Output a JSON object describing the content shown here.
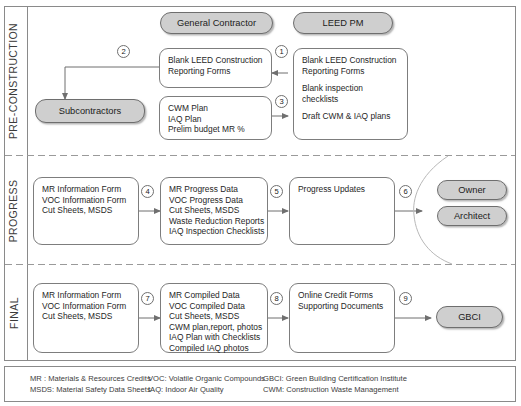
{
  "diagram": {
    "frame_color": "#8a8a8a",
    "box_border_color": "#7d7d7d",
    "pill_fill_color": "#cfcfcf",
    "arrow_color": "#6f6f6f"
  },
  "phases": [
    {
      "id": "pre-construction",
      "label": "PRE-CONSTRUCTION"
    },
    {
      "id": "progress",
      "label": "PROGRESS"
    },
    {
      "id": "final",
      "label": "FINAL"
    }
  ],
  "actors": {
    "general_contractor": "General Contractor",
    "leed_pm": "LEED PM",
    "subcontractors": "Subcontractors",
    "owner": "Owner",
    "architect": "Architect",
    "gbci": "GBCI"
  },
  "preconstruction": {
    "gc_forms_box": {
      "lines": [
        "Blank LEED Construction",
        "Reporting Forms"
      ]
    },
    "gc_plans_box": {
      "lines": [
        "CWM Plan",
        "IAQ Plan",
        "Prelim budget MR %"
      ]
    },
    "pm_box": {
      "group1": [
        "Blank LEED Construction",
        "Reporting Forms"
      ],
      "group2": [
        "Blank inspection",
        "checklists"
      ],
      "group3": [
        "Draft CWM & IAQ plans"
      ]
    },
    "steps": {
      "s1": "1",
      "s2": "2",
      "s3": "3"
    }
  },
  "progress": {
    "sub_box": {
      "lines": [
        "MR Information Form",
        "VOC Information Form",
        "Cut Sheets, MSDS"
      ]
    },
    "gc_box": {
      "lines": [
        "MR Progress Data",
        "VOC Progress Data",
        "Cut Sheets, MSDS",
        "Waste Reduction Reports",
        "IAQ Inspection Checklists"
      ]
    },
    "pm_box": {
      "lines": [
        "Progress Updates"
      ]
    },
    "steps": {
      "s4": "4",
      "s5": "5",
      "s6": "6"
    }
  },
  "final": {
    "sub_box": {
      "lines": [
        "MR Information Form",
        "VOC Information Form",
        "Cut Sheets, MSDS"
      ]
    },
    "gc_box": {
      "lines": [
        "MR Compiled Data",
        "VOC Compiled Data",
        "Cut Sheets, MSDS",
        "CWM plan,report, photos",
        "IAQ Plan with Checklists",
        "Compiled IAQ photos"
      ]
    },
    "pm_box": {
      "lines": [
        "Online Credit Forms",
        "Supporting Documents"
      ]
    },
    "steps": {
      "s7": "7",
      "s8": "8",
      "s9": "9"
    }
  },
  "legend": {
    "col1": [
      "MR : Materials & Resources Credits",
      "MSDS: Material Safety Data Sheets"
    ],
    "col2": [
      "VOC: Volatile Organic Compounds",
      "IAQ: Indoor Air Quality"
    ],
    "col3": [
      "GBCI: Green Building Certification Institute",
      "CWM: Construction Waste Management"
    ]
  }
}
